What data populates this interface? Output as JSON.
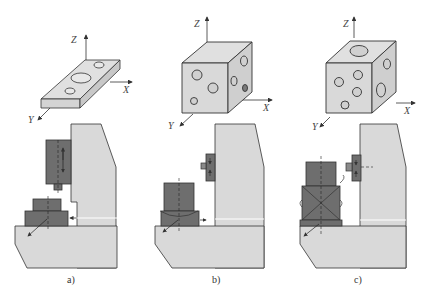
{
  "figure": {
    "panels": [
      {
        "id": "a",
        "caption": "a)",
        "workpiece": "flat plate with holes",
        "axes": {
          "x": "X",
          "y": "Y",
          "z": "Z"
        }
      },
      {
        "id": "b",
        "caption": "b)",
        "workpiece": "cube with holes on multiple faces",
        "axes": {
          "x": "X",
          "y": "Y",
          "z": "Z"
        }
      },
      {
        "id": "c",
        "caption": "c)",
        "workpiece": "cube with holes on all faces including top",
        "axes": {
          "x": "X",
          "y": "Y",
          "z": "Z"
        }
      }
    ],
    "colors": {
      "light_gray": "#d9d9d9",
      "dark_gray": "#6e6e6e",
      "outline": "#333333"
    }
  }
}
